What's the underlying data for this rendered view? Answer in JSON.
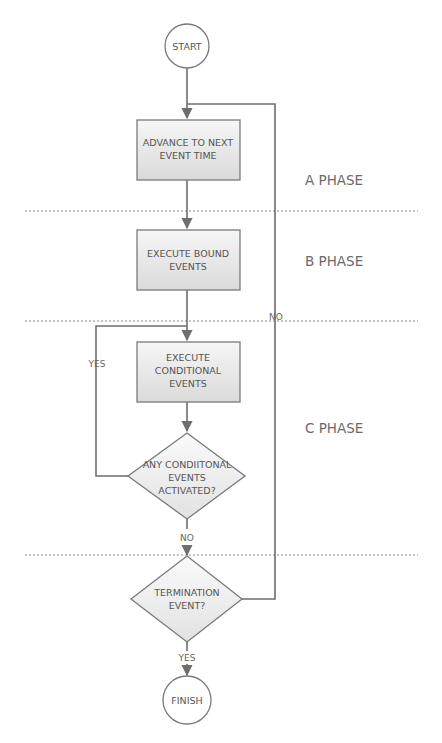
{
  "diagram": {
    "type": "flowchart",
    "nodes": {
      "start": {
        "label": "START",
        "shape": "circle"
      },
      "advance": {
        "label_lines": [
          "ADVANCE TO NEXT",
          "EVENT TIME"
        ],
        "shape": "rectangle"
      },
      "bound": {
        "label_lines": [
          "EXECUTE BOUND",
          "EVENTS"
        ],
        "shape": "rectangle"
      },
      "conditional": {
        "label_lines": [
          "EXECUTE",
          "CONDITIONAL",
          "EVENTS"
        ],
        "shape": "rectangle"
      },
      "any_activated": {
        "label_lines": [
          "ANY CONDIITONAL",
          "EVENTS",
          "ACTIVATED?"
        ],
        "shape": "diamond"
      },
      "termination": {
        "label_lines": [
          "TERMINATION",
          "EVENT?"
        ],
        "shape": "diamond"
      },
      "finish": {
        "label": "FINISH",
        "shape": "circle"
      }
    },
    "phases": [
      {
        "label": "A PHASE"
      },
      {
        "label": "B PHASE"
      },
      {
        "label": "C PHASE"
      }
    ],
    "edge_labels": {
      "loop_yes": "YES",
      "any_no": "NO",
      "term_no": "NO",
      "term_yes": "YES"
    },
    "colors": {
      "box_fill_top": "#f4f4f4",
      "box_fill_bottom": "#dcdcdc",
      "stroke": "#7a7a7a",
      "text": "#555555"
    }
  }
}
